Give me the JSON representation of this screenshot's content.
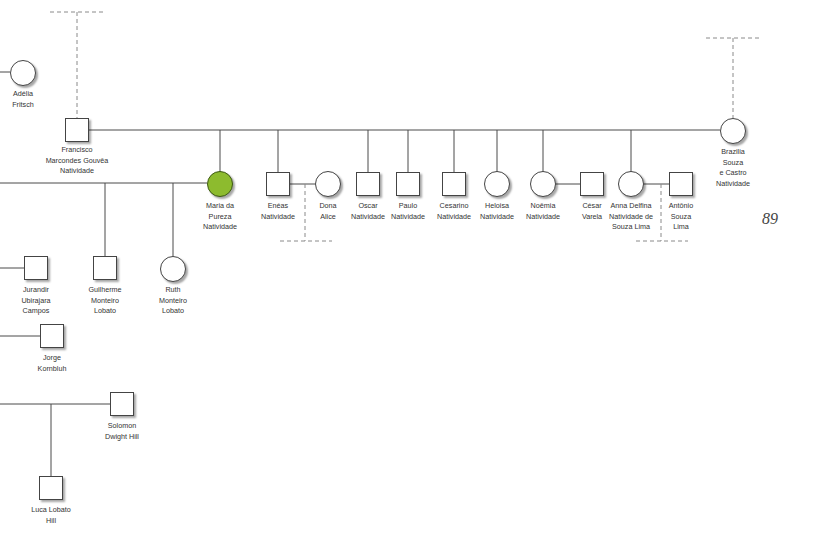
{
  "page_number": "89",
  "colors": {
    "highlight": "#8dbb2e",
    "line": "#4a4a4a"
  },
  "people": [
    {
      "id": "adelia",
      "name": "Adélia\nFritsch",
      "shape": "circle"
    },
    {
      "id": "francisco",
      "name": "Francisco\nMarcondes Gouvêa\nNatividade",
      "shape": "square"
    },
    {
      "id": "brazilia",
      "name": "Brazilia\nSouza\ne Castro\nNatividade",
      "shape": "circle"
    },
    {
      "id": "maria",
      "name": "Maria da\nPureza\nNatividade",
      "shape": "circle",
      "highlighted": true
    },
    {
      "id": "eneas",
      "name": "Enéas\nNatividade",
      "shape": "square"
    },
    {
      "id": "dona_alice",
      "name": "Dona\nAlice",
      "shape": "circle"
    },
    {
      "id": "oscar",
      "name": "Oscar\nNatividade",
      "shape": "square"
    },
    {
      "id": "paulo",
      "name": "Paulo\nNatividade",
      "shape": "square"
    },
    {
      "id": "cesarino",
      "name": "Cesarino\nNatividade",
      "shape": "square"
    },
    {
      "id": "heloisa",
      "name": "Heloisa\nNatividade",
      "shape": "circle"
    },
    {
      "id": "noemia",
      "name": "Noêmia\nNatividade",
      "shape": "circle"
    },
    {
      "id": "cesar",
      "name": "César\nVarela",
      "shape": "square"
    },
    {
      "id": "anna",
      "name": "Anna Delfina\nNatividade de\nSouza Lima",
      "shape": "circle"
    },
    {
      "id": "antonio",
      "name": "Antônio\nSouza\nLima",
      "shape": "square"
    },
    {
      "id": "jurandir",
      "name": "Jurandir\nUbirajara\nCampos",
      "shape": "square"
    },
    {
      "id": "guilherme",
      "name": "Guilherme\nMonteiro\nLobato",
      "shape": "square"
    },
    {
      "id": "ruth",
      "name": "Ruth\nMonteiro\nLobato",
      "shape": "circle"
    },
    {
      "id": "jorge",
      "name": "Jorge\nKornbluh",
      "shape": "square"
    },
    {
      "id": "solomon",
      "name": "Solomon\nDwight Hill",
      "shape": "square"
    },
    {
      "id": "luca",
      "name": "Luca Lobato\nHill",
      "shape": "square"
    }
  ]
}
